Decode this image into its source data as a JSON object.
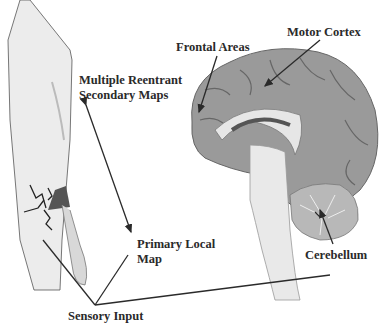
{
  "labels": {
    "frontal_areas": "Frontal Areas",
    "motor_cortex": "Motor Cortex",
    "secondary_maps_line1": "Multiple Reentrant",
    "secondary_maps_line2": "Secondary Maps",
    "primary_map_line1": "Primary Local",
    "primary_map_line2": "Map",
    "cerebellum": "Cerebellum",
    "sensory_input": "Sensory Input"
  },
  "colors": {
    "brain_fill": "#9a9a9a",
    "brain_light": "#d9d9d9",
    "arm_fill": "#ececec",
    "line": "#2a2a2a"
  }
}
